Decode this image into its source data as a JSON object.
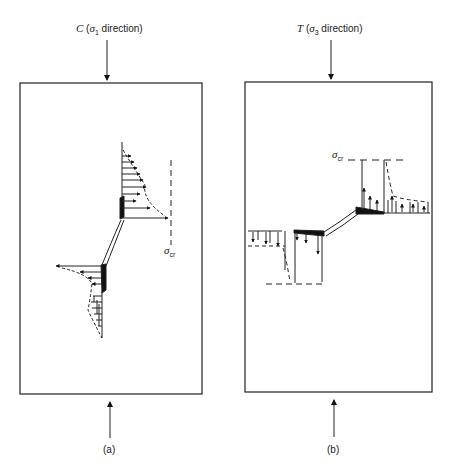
{
  "panel_a": {
    "title_prefix": "C",
    "title_sigma": "σ",
    "title_sub": "1",
    "title_suffix": " direction)",
    "sigma_label": "σ",
    "sigma_sub": "cr",
    "caption": "(a)"
  },
  "panel_b": {
    "title_prefix": "T",
    "title_sigma": "σ",
    "title_sub": "3",
    "title_suffix": " direction)",
    "sigma_label": "σ",
    "sigma_sub": "cr",
    "caption": "(b)"
  },
  "colors": {
    "line": "#222222",
    "fill": "#111111"
  }
}
